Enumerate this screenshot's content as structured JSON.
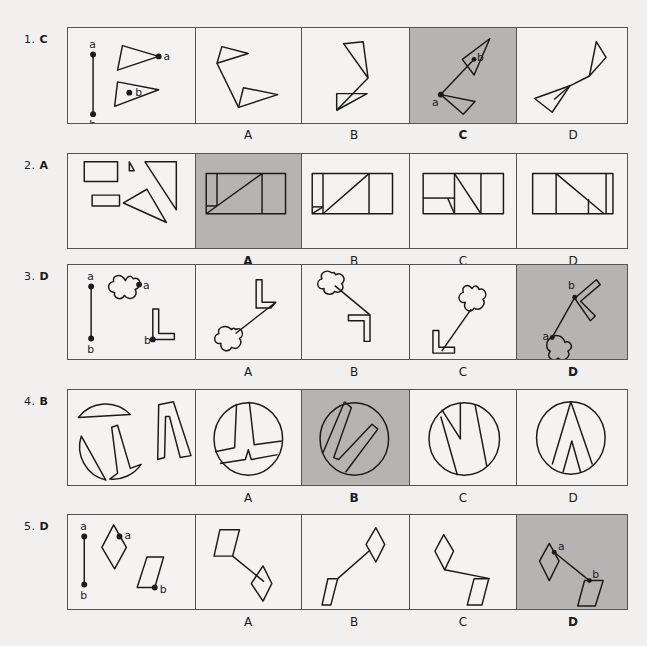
{
  "questions": [
    {
      "number": "1.",
      "answer": "C",
      "options": [
        "A",
        "B",
        "C",
        "D"
      ],
      "selected": "C",
      "point_labels": {
        "a": "a",
        "b": "b"
      }
    },
    {
      "number": "2.",
      "answer": "A",
      "options": [
        "A",
        "B",
        "C",
        "D"
      ],
      "selected": "A"
    },
    {
      "number": "3.",
      "answer": "D",
      "options": [
        "A",
        "B",
        "C",
        "D"
      ],
      "selected": "D",
      "point_labels": {
        "a": "a",
        "b": "b"
      }
    },
    {
      "number": "4.",
      "answer": "B",
      "options": [
        "A",
        "B",
        "C",
        "D"
      ],
      "selected": "B"
    },
    {
      "number": "5.",
      "answer": "D",
      "options": [
        "A",
        "B",
        "C",
        "D"
      ],
      "selected": "D",
      "point_labels": {
        "a": "a",
        "b": "b"
      }
    }
  ],
  "colors": {
    "selected_fill": "#b5b4b2",
    "background": "#f1f0ee",
    "line": "#1a1a1a"
  }
}
